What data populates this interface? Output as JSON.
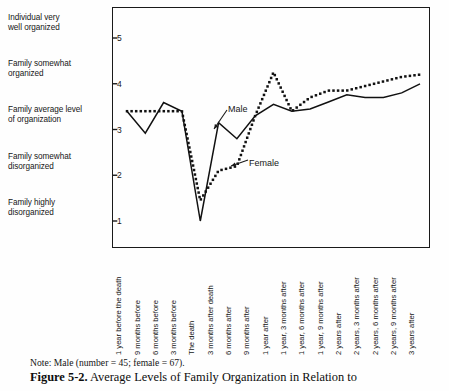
{
  "chart_data": {
    "type": "line",
    "title": "Average Levels of Family Organization in Relation to",
    "figure_number": "Figure 5-2.",
    "note": "Note: Male (number  =  45; female  =  67).",
    "xlabel": "",
    "ylabel": "",
    "ylim": [
      0.55,
      5.45
    ],
    "yticks": [
      1,
      2,
      3,
      4,
      5
    ],
    "ytick_labels": [
      "1",
      "2",
      "3",
      "4",
      "5"
    ],
    "y_category_labels": [
      {
        "value": 5,
        "text_line1": "Individual very",
        "text_line2": "well organized"
      },
      {
        "value": 4,
        "text_line1": "Family somewhat",
        "text_line2": "organized"
      },
      {
        "value": 3,
        "text_line1": "Family average level",
        "text_line2": "of organization"
      },
      {
        "value": 2,
        "text_line1": "Family somewhat",
        "text_line2": "disorganized"
      },
      {
        "value": 1,
        "text_line1": "Family highly",
        "text_line2": "disorganized"
      }
    ],
    "grid": false,
    "legend_position": "inline-annotation",
    "categories": [
      "1 year before the death",
      "9 months before",
      "6 months before",
      "3 months before",
      "The death",
      "3 months after death",
      "6 months after",
      "9 months after",
      "1 year after",
      "1 year, 3 months after",
      "1 year, 6 months after",
      "1 year, 9 months after",
      "2 years after",
      "2 years, 3 months after",
      "2 years, 6 months after",
      "2 years, 9 months after",
      "3 years after"
    ],
    "series": [
      {
        "name": "Male",
        "style": "solid",
        "color": "#111111",
        "values": [
          3.4,
          2.92,
          3.59,
          3.4,
          1.0,
          3.15,
          2.8,
          3.3,
          3.55,
          3.4,
          3.45,
          3.6,
          3.76,
          3.7,
          3.7,
          3.8,
          4.0
        ]
      },
      {
        "name": "Female",
        "style": "dotted",
        "color": "#111111",
        "values": [
          3.4,
          3.4,
          3.4,
          3.4,
          1.45,
          2.1,
          2.2,
          3.3,
          4.25,
          3.4,
          3.7,
          3.85,
          3.85,
          3.95,
          4.05,
          4.15,
          4.2
        ]
      }
    ],
    "annotations": [
      {
        "label": "Male",
        "text_x": 228,
        "text_y": 104,
        "arrow_from_x": 227,
        "arrow_from_y": 110,
        "arrow_to_x": 214,
        "arrow_to_y": 129
      },
      {
        "label": "Female",
        "text_x": 249,
        "text_y": 158,
        "arrow_from_x": 248,
        "arrow_from_y": 160,
        "arrow_to_x": 231,
        "arrow_to_y": 166
      }
    ]
  }
}
